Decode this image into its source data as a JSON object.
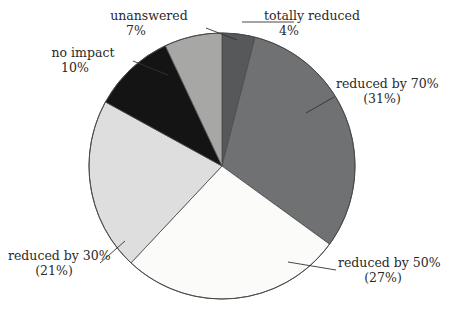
{
  "chart_data": {
    "type": "pie",
    "title": "",
    "subtitle": "",
    "xlabel": "",
    "ylabel": "",
    "legend_position": "none",
    "grid": false,
    "start_angle_deg": 0,
    "direction": "clockwise",
    "categories": [
      "totally reduced",
      "reduced by 70%",
      "reduced by 50%",
      "reduced by 30%",
      "no impact",
      "unanswered"
    ],
    "values": [
      4,
      31,
      27,
      21,
      10,
      7
    ],
    "value_unit": "percent",
    "slices": [
      {
        "name": "totally reduced",
        "value": 4,
        "value_text": "4%",
        "label_line1": "totally reduced",
        "label_line2": "4%",
        "color": "#56585a",
        "start_deg": 0,
        "end_deg": 14.4
      },
      {
        "name": "reduced by 70%",
        "value": 31,
        "value_text": "(31%)",
        "label_line1": "reduced by 70%",
        "label_line2": "(31%)",
        "color": "#6f7173",
        "start_deg": 14.4,
        "end_deg": 126.0
      },
      {
        "name": "reduced by 50%",
        "value": 27,
        "value_text": "(27%)",
        "label_line1": "reduced by 50%",
        "label_line2": "(27%)",
        "color": "#fbfbfa",
        "start_deg": 126.0,
        "end_deg": 223.2
      },
      {
        "name": "reduced by 30%",
        "value": 21,
        "value_text": "(21%)",
        "label_line1": "reduced by 30%",
        "label_line2": "(21%)",
        "color": "#dedede",
        "start_deg": 223.2,
        "end_deg": 298.8
      },
      {
        "name": "no impact",
        "value": 10,
        "value_text": "10%",
        "label_line1": "no impact",
        "label_line2": "10%",
        "color": "#141414",
        "start_deg": 298.8,
        "end_deg": 334.8
      },
      {
        "name": "unanswered",
        "value": 7,
        "value_text": "7%",
        "label_line1": "unanswered",
        "label_line2": "7%",
        "color": "#a7a8a6",
        "start_deg": 334.8,
        "end_deg": 360.0
      }
    ],
    "total": 100,
    "outline_color": "#4a4a4a",
    "background": "#ffffff"
  },
  "labels": {
    "unanswered": {
      "name": "unanswered",
      "value": "7%"
    },
    "totally_reduced": {
      "name": "totally reduced",
      "value": "4%"
    },
    "no_impact": {
      "name": "no impact",
      "value": "10%"
    },
    "reduced_70": {
      "name": "reduced by 70%",
      "value": "(31%)"
    },
    "reduced_50": {
      "name": "reduced by 50%",
      "value": "(27%)"
    },
    "reduced_30": {
      "name": "reduced by 30%",
      "value": "(21%)"
    }
  }
}
